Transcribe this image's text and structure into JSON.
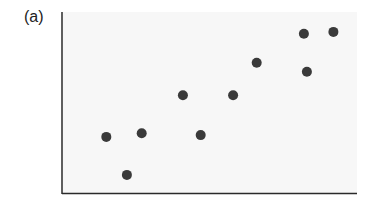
{
  "figure": {
    "panel_label": "(a)"
  },
  "chart_data": {
    "type": "scatter",
    "title": "",
    "xlabel": "",
    "ylabel": "",
    "xlim": [
      0,
      10
    ],
    "ylim": [
      0,
      10
    ],
    "grid": false,
    "legend": null,
    "tick_labels": {
      "x": [],
      "y": []
    },
    "marker_color": "#3a3a3a",
    "points": [
      {
        "x": 1.5,
        "y": 3.1
      },
      {
        "x": 2.2,
        "y": 1.0
      },
      {
        "x": 2.7,
        "y": 3.3
      },
      {
        "x": 4.1,
        "y": 5.4
      },
      {
        "x": 4.7,
        "y": 3.2
      },
      {
        "x": 5.8,
        "y": 5.4
      },
      {
        "x": 6.6,
        "y": 7.2
      },
      {
        "x": 8.2,
        "y": 8.8
      },
      {
        "x": 8.3,
        "y": 6.7
      },
      {
        "x": 9.2,
        "y": 8.9
      }
    ]
  }
}
